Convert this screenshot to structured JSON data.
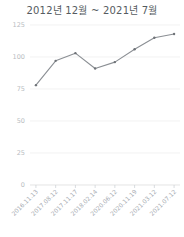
{
  "chart": {
    "title": "2012년 12월 ~ 2021년 7월"
  },
  "chart_data": {
    "type": "line",
    "title": "2012년 12월 ~ 2021년 7월",
    "xlabel": "",
    "ylabel": "",
    "grid": true,
    "legend": false,
    "ylim": [
      0,
      125
    ],
    "yticks": [
      0,
      25,
      50,
      75,
      100,
      125
    ],
    "ytick_labels": [
      "0",
      "25",
      "50",
      "75",
      "100",
      "125"
    ],
    "categories": [
      "2016.11.13",
      "2017.08.12",
      "2017.11.17",
      "2018.02.14",
      "2020.06.12",
      "2020.11.19",
      "2021.03.12",
      "2021.07.12"
    ],
    "values": [
      78,
      97,
      103,
      91,
      96,
      106,
      115,
      118
    ],
    "series": [
      {
        "name": "value",
        "values": [
          78,
          97,
          103,
          91,
          96,
          106,
          115,
          118
        ],
        "color": "#8b8f94",
        "marker": "dot"
      }
    ]
  }
}
